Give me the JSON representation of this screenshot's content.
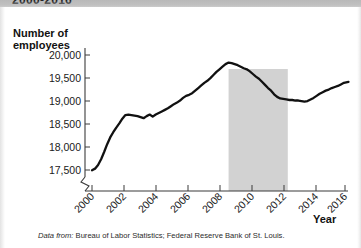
{
  "figure": {
    "title_partial": "2000-2016",
    "caption_prefix": "Data from:",
    "caption_body": " Bureau of Labor Statistics; Federal Reserve Bank of St. Louis."
  },
  "axes": {
    "y_title_line1": "Number of",
    "y_title_line2": "employees",
    "x_title": "Year",
    "y_ticks": [
      "17,500",
      "18,000",
      "18,500",
      "19,000",
      "19,500",
      "20,000"
    ],
    "x_ticks": [
      "2000",
      "2002",
      "2004",
      "2006",
      "2008",
      "2010",
      "2012",
      "2014",
      "2016"
    ]
  },
  "colors": {
    "line": "#111111",
    "recession_band": "#d2d2d2",
    "axis": "#3b3b3b",
    "title_band": "#b9b9b9"
  },
  "chart_data": {
    "type": "line",
    "title": "2000-2016",
    "xlabel": "Year",
    "ylabel": "Number of employees",
    "xlim": [
      2000,
      2017
    ],
    "ylim": [
      17400,
      20150
    ],
    "grid": false,
    "legend": null,
    "y_tick_values": [
      17500,
      18000,
      18500,
      19000,
      19500,
      20000
    ],
    "x_tick_values": [
      2000,
      2002,
      2004,
      2006,
      2008,
      2010,
      2012,
      2014,
      2016
    ],
    "axis_break": true,
    "annotations": [
      {
        "type": "shaded_band",
        "label": "recession-band",
        "x_start": 2009.0,
        "x_end": 2012.9,
        "color": "#d2d2d2"
      }
    ],
    "series": [
      {
        "name": "Number of employees",
        "x": [
          2000.0,
          2000.2,
          2000.4,
          2000.6,
          2000.8,
          2001.0,
          2001.2,
          2001.4,
          2001.6,
          2001.8,
          2002.0,
          2002.2,
          2002.4,
          2002.6,
          2002.8,
          2003.0,
          2003.2,
          2003.4,
          2003.6,
          2003.8,
          2004.0,
          2004.2,
          2004.4,
          2004.6,
          2004.8,
          2005.0,
          2005.2,
          2005.4,
          2005.6,
          2005.8,
          2006.0,
          2006.2,
          2006.4,
          2006.6,
          2006.8,
          2007.0,
          2007.2,
          2007.4,
          2007.6,
          2007.8,
          2008.0,
          2008.2,
          2008.4,
          2008.6,
          2008.8,
          2009.0,
          2009.2,
          2009.4,
          2009.6,
          2009.8,
          2010.0,
          2010.2,
          2010.4,
          2010.6,
          2010.8,
          2011.0,
          2011.2,
          2011.4,
          2011.6,
          2011.8,
          2012.0,
          2012.2,
          2012.4,
          2012.6,
          2012.8,
          2013.0,
          2013.2,
          2013.4,
          2013.6,
          2013.8,
          2014.0,
          2014.2,
          2014.4,
          2014.6,
          2014.8,
          2015.0,
          2015.2,
          2015.4,
          2015.6,
          2015.8,
          2016.0,
          2016.2,
          2016.4,
          2016.6,
          2016.9
        ],
        "values": [
          17800,
          17830,
          17900,
          18010,
          18150,
          18300,
          18430,
          18530,
          18620,
          18700,
          18790,
          18860,
          18870,
          18860,
          18850,
          18840,
          18820,
          18800,
          18840,
          18870,
          18830,
          18870,
          18900,
          18930,
          18960,
          18990,
          19030,
          19070,
          19100,
          19140,
          19190,
          19230,
          19250,
          19280,
          19330,
          19380,
          19430,
          19480,
          19520,
          19570,
          19630,
          19690,
          19740,
          19790,
          19840,
          19870,
          19860,
          19840,
          19820,
          19790,
          19760,
          19740,
          19700,
          19650,
          19600,
          19560,
          19500,
          19440,
          19380,
          19330,
          19260,
          19210,
          19180,
          19170,
          19160,
          19150,
          19150,
          19140,
          19140,
          19130,
          19120,
          19130,
          19160,
          19190,
          19230,
          19270,
          19300,
          19330,
          19350,
          19380,
          19400,
          19420,
          19450,
          19480,
          19500
        ]
      }
    ]
  }
}
